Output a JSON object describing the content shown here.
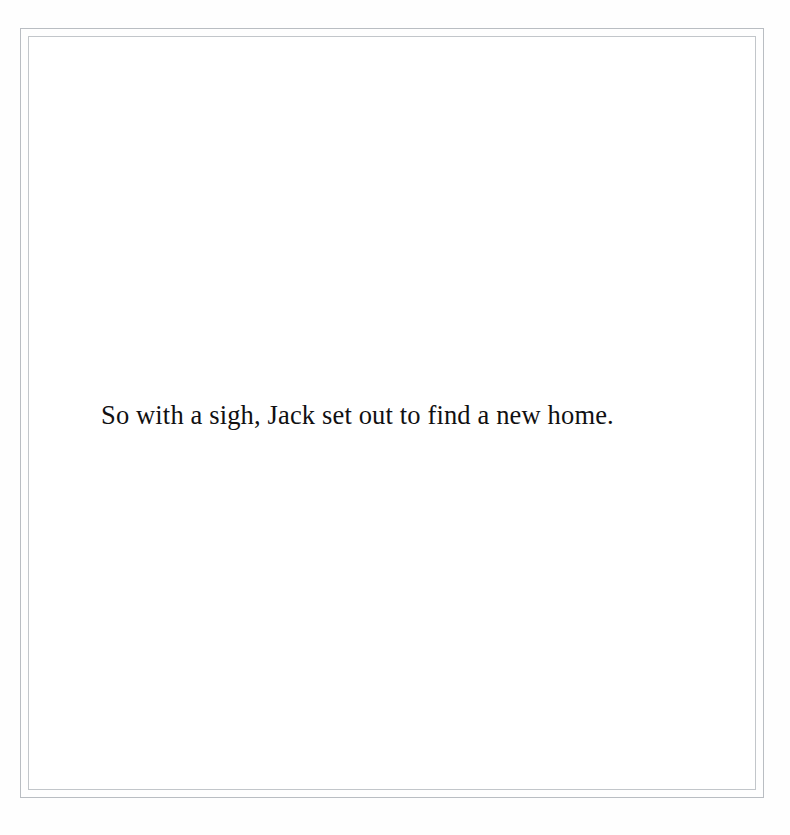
{
  "page": {
    "background_color": "#fefefe",
    "paper_color": "#ffffff",
    "frame": {
      "outer_rule_color": "#b9bdc2",
      "inner_rule_color": "#c2c6ca",
      "style": "double-rule-border"
    }
  },
  "content": {
    "body_text": "So with a sigh, Jack set out to find a new home.",
    "text_color": "#111012",
    "alignment": "left"
  }
}
